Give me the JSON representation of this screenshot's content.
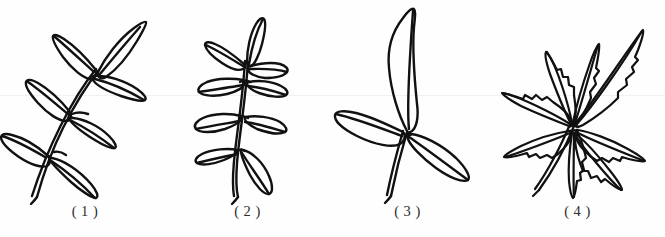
{
  "plate": {
    "background_color": "#ffffff",
    "ink_color": "#111111",
    "width": 665,
    "height": 237,
    "description": "Four hand-drawn black-ink botanical line illustrations of compound leaf types, arranged in a row, each with a parenthesised number caption beneath."
  },
  "figures": [
    {
      "id": "figure-1",
      "caption": "( 1 )",
      "number": "1",
      "leaf_type": "odd-pinnately-compound-leaf",
      "name": "pinnately compound leaf tilted right",
      "leaflet_count": "7",
      "center_x": 55,
      "caption_x": 55,
      "notes": "Leaflets paired along an oblique rachis with one terminal leaflet; long double-line petiole at lower left."
    },
    {
      "id": "figure-2",
      "caption": "( 2 )",
      "number": "2",
      "leaf_type": "odd-pinnately-compound-leaf-upright",
      "name": "pinnately compound leaf with opposite rounded leaflets",
      "leaflet_count": "7",
      "center_x": 245,
      "caption_x": 245,
      "notes": "Three opposite pairs of broad oval leaflets plus a narrow terminal leaflet on a vertical rachis."
    },
    {
      "id": "figure-3",
      "caption": "( 3 )",
      "number": "3",
      "leaf_type": "trifoliate-compound-leaf",
      "name": "trifoliate leaf",
      "leaflet_count": "3",
      "center_x": 410,
      "caption_x": 410,
      "notes": "One large upright terminal leaflet and two lateral leaflets meeting at a single junction above the petiole."
    },
    {
      "id": "figure-4",
      "caption": "( 4 )",
      "number": "4",
      "leaf_type": "palmately-compound-leaf",
      "name": "palmately compound leaf with serrated leaflets",
      "leaflet_count": "7",
      "center_x": 578,
      "caption_x": 578,
      "notes": "Narrow lance-shaped leaflets with toothed margins radiating from a common point at the petiole tip."
    }
  ]
}
